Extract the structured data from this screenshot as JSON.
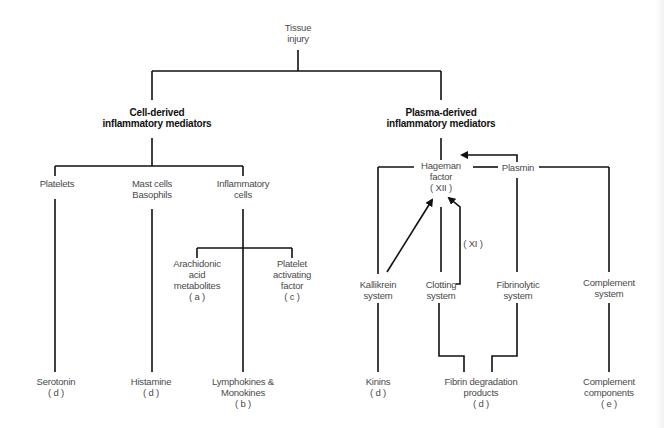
{
  "diagram": {
    "root": "Tissue\ninjury",
    "cell_header": "Cell-derived\ninflammatory mediators",
    "plasma_header": "Plasma-derived\ninflammatory mediators",
    "cell": {
      "platelets": "Platelets",
      "mast": "Mast cells\nBasophils",
      "inflammatory": "Inflammatory\ncells",
      "arachidonic": "Arachidonic\nacid\nmetabolites\n( a )",
      "paf": "Platelet\nactivating\nfactor\n( c )",
      "serotonin": "Serotonin\n( d )",
      "histamine": "Histamine\n( d )",
      "lymphokines": "Lymphokines &\nMonokines\n( b )"
    },
    "plasma": {
      "hageman": "Hageman\nfactor\n( XII )",
      "plasmin": "Plasmin",
      "xi": "( XI )",
      "kallikrein": "Kallikrein\nsystem",
      "clotting": "Clotting\nsystem",
      "fibrinolytic": "Fibrinolytic\nsystem",
      "complement": "Complement\nsystem",
      "kinins": "Kinins\n( d )",
      "fibrin": "Fibrin degradation\nproducts\n( d )",
      "complement_components": "Complement\ncomponents\n( e )"
    }
  },
  "colors": {
    "line": "#111111",
    "text": "#4a4a4a",
    "header": "#111111"
  }
}
